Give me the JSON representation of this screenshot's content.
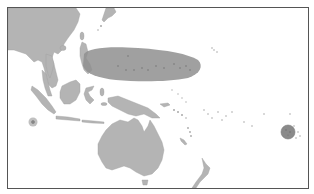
{
  "map": {
    "title": "Locator map",
    "region_label": "Highlighted region",
    "highlighted_areas": [
      {
        "name": "main-highlight",
        "shape": "elongated-ellipse",
        "color": "#8f8f8f"
      },
      {
        "name": "small-marker-west",
        "shape": "circle",
        "color": "#8a8a8a"
      },
      {
        "name": "marker-east",
        "shape": "circle",
        "color": "#8a8a8a"
      }
    ],
    "colors": {
      "land": "#b4b4b4",
      "sea": "#ffffff",
      "highlight": "#8f8f8f",
      "frame": "#555555"
    },
    "landmasses": [
      "Asia",
      "Indochina",
      "Philippines",
      "Borneo",
      "Sumatra",
      "Sulawesi",
      "New Guinea",
      "Australia",
      "Tasmania",
      "New Zealand",
      "Japan",
      "Taiwan",
      "Pacific islands"
    ]
  }
}
